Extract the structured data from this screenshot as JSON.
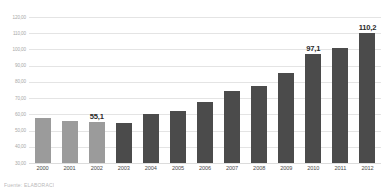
{
  "chart_data": {
    "type": "bar",
    "title": "",
    "xlabel": "",
    "ylabel": "",
    "ylim": [
      30,
      120
    ],
    "grid": true,
    "legend": "none",
    "decimal_separator": ",",
    "y_ticks": [
      "30,00",
      "40,00",
      "50,00",
      "60,00",
      "70,00",
      "80,00",
      "90,00",
      "100,00",
      "110,00",
      "120,00"
    ],
    "y_tick_values": [
      30,
      40,
      50,
      60,
      70,
      80,
      90,
      100,
      110,
      120
    ],
    "categories": [
      "2000",
      "2001",
      "2002",
      "2003",
      "2004",
      "2005",
      "2006",
      "2007",
      "2008",
      "2009",
      "2010",
      "2011",
      "2012"
    ],
    "values": [
      57.5,
      56.0,
      55.1,
      54.8,
      60.2,
      62.3,
      67.6,
      74.6,
      77.5,
      85.4,
      97.1,
      100.6,
      110.2
    ],
    "bar_colors": [
      "#9b9b9b",
      "#9b9b9b",
      "#9b9b9b",
      "#4b4b4b",
      "#4b4b4b",
      "#4b4b4b",
      "#4b4b4b",
      "#4b4b4b",
      "#4b4b4b",
      "#4b4b4b",
      "#4b4b4b",
      "#4b4b4b",
      "#4b4b4b"
    ],
    "data_labels": [
      "",
      "",
      "55,1",
      "",
      "",
      "",
      "",
      "",
      "",
      "",
      "97,1",
      "",
      "110,2"
    ],
    "annotations": []
  },
  "colors": {
    "bar_light": "#9b9b9b",
    "bar_dark": "#4b4b4b",
    "gridline": "#e4e4e4",
    "y_tick_text": "#a8a8a8",
    "x_tick_text": "#4a4a4a",
    "data_label_text": "#2b2b2b",
    "background": "#ffffff"
  },
  "footnote": {
    "text": "Fuente: ELABORACI"
  }
}
